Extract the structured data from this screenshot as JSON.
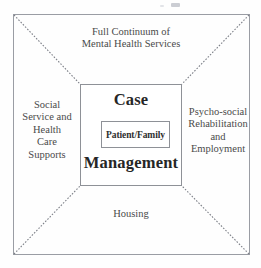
{
  "diagram": {
    "title_text_present": false,
    "center": {
      "top_word": "Case",
      "bottom_word": "Management",
      "inner_box_label": "Patient/Family"
    },
    "regions": {
      "top": "Full Continuum of\nMental Health Services",
      "left": "Social\nService and\nHealth\nCare\nSupports",
      "right": "Psycho-social\nRehabilitation\nand\nEmployment",
      "bottom": "Housing"
    },
    "colors": {
      "frame_stroke": "#9a9da4",
      "box_stroke": "#8e9197",
      "diagonal_stroke": "#7e8189",
      "text": "#4a4a4a",
      "center_text": "#262626",
      "background": "#fefefe"
    },
    "geometry": {
      "outer_frame": {
        "x": 13,
        "y": 14,
        "width": 237,
        "height": 241
      },
      "center_box": {
        "x": 80,
        "y": 84,
        "width": 102,
        "height": 102
      },
      "inner_box": {
        "x": 100,
        "y": 120,
        "width": 69,
        "height": 27
      },
      "diagonals": [
        {
          "name": "top-left",
          "x1": 14,
          "y1": 15,
          "x2": 80,
          "y2": 84
        },
        {
          "name": "top-right",
          "x1": 249,
          "y1": 15,
          "x2": 182,
          "y2": 84
        },
        {
          "name": "bottom-left",
          "x1": 14,
          "y1": 254,
          "x2": 80,
          "y2": 186
        },
        {
          "name": "bottom-right",
          "x1": 249,
          "y1": 254,
          "x2": 182,
          "y2": 186
        }
      ]
    }
  }
}
